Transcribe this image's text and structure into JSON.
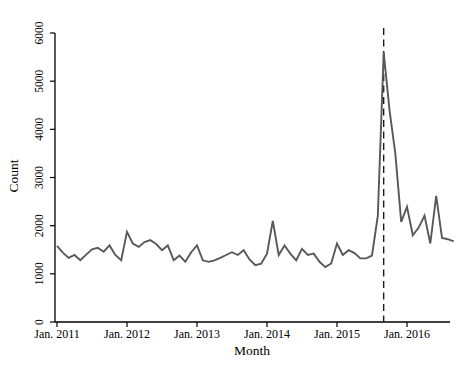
{
  "figure": {
    "kind": "statistical-line-chart",
    "background_color": "#ffffff",
    "axis_color": "#000000"
  },
  "chart_data": {
    "type": "line",
    "title": "",
    "xlabel": "Month",
    "ylabel": "Count",
    "ylim": [
      0,
      6000
    ],
    "y_ticks": [
      0,
      1000,
      2000,
      3000,
      4000,
      5000,
      6000
    ],
    "x_ticks": [
      {
        "label": "Jan. 2011",
        "month_index": 0
      },
      {
        "label": "Jan. 2012",
        "month_index": 12
      },
      {
        "label": "Jan. 2013",
        "month_index": 24
      },
      {
        "label": "Jan. 2014",
        "month_index": 36
      },
      {
        "label": "Jan. 2015",
        "month_index": 48
      },
      {
        "label": "Jan. 2016",
        "month_index": 60
      }
    ],
    "x_range": {
      "start": "Jan 2011",
      "end": "Sep 2016",
      "interval": "monthly"
    },
    "grid": false,
    "legend": "none",
    "series": [
      {
        "name": "monthly-count",
        "color": "#585858",
        "stroke_width": 1.9,
        "values": [
          1580,
          1440,
          1330,
          1390,
          1280,
          1400,
          1510,
          1540,
          1460,
          1590,
          1390,
          1280,
          1870,
          1630,
          1560,
          1660,
          1700,
          1620,
          1490,
          1590,
          1280,
          1380,
          1250,
          1450,
          1590,
          1280,
          1250,
          1280,
          1330,
          1390,
          1450,
          1390,
          1490,
          1300,
          1180,
          1210,
          1420,
          2100,
          1390,
          1590,
          1420,
          1280,
          1520,
          1390,
          1420,
          1250,
          1140,
          1215,
          1630,
          1390,
          1490,
          1430,
          1320,
          1320,
          1380,
          2200,
          5600,
          4400,
          3500,
          2080,
          2390,
          1800,
          1960,
          2210,
          1630,
          2620,
          1745,
          1720,
          1675
        ]
      }
    ],
    "annotations": [
      {
        "type": "vline",
        "style": "dashed",
        "color": "#1a1a1a",
        "month_index": 56,
        "month": "Sep 2015",
        "note": "dashed vertical reference line at the series peak"
      }
    ]
  }
}
